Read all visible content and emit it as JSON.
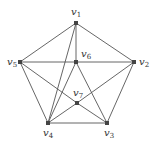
{
  "graph": {
    "nodes": [
      {
        "id": "v1",
        "label": "v",
        "sub": "1",
        "x": 76,
        "y": 23,
        "lx": 71,
        "ly": 15
      },
      {
        "id": "v2",
        "label": "v",
        "sub": "2",
        "x": 134,
        "y": 62,
        "lx": 139,
        "ly": 65
      },
      {
        "id": "v3",
        "label": "v",
        "sub": "3",
        "x": 107,
        "y": 123,
        "lx": 104,
        "ly": 136
      },
      {
        "id": "v4",
        "label": "v",
        "sub": "4",
        "x": 48,
        "y": 123,
        "lx": 43,
        "ly": 136
      },
      {
        "id": "v5",
        "label": "v",
        "sub": "5",
        "x": 20,
        "y": 62,
        "lx": 7,
        "ly": 65
      },
      {
        "id": "v6",
        "label": "v",
        "sub": "6",
        "x": 76,
        "y": 62,
        "lx": 81,
        "ly": 57
      },
      {
        "id": "v7",
        "label": "v",
        "sub": "7",
        "x": 77,
        "y": 103,
        "lx": 73,
        "ly": 96
      }
    ],
    "edges": [
      [
        "v1",
        "v5"
      ],
      [
        "v1",
        "v2"
      ],
      [
        "v1",
        "v6"
      ],
      [
        "v1",
        "v4"
      ],
      [
        "v5",
        "v6"
      ],
      [
        "v6",
        "v2"
      ],
      [
        "v5",
        "v4"
      ],
      [
        "v5",
        "v7"
      ],
      [
        "v2",
        "v3"
      ],
      [
        "v2",
        "v7"
      ],
      [
        "v6",
        "v4"
      ],
      [
        "v6",
        "v3"
      ],
      [
        "v7",
        "v3"
      ],
      [
        "v7",
        "v4"
      ],
      [
        "v4",
        "v3"
      ]
    ]
  }
}
